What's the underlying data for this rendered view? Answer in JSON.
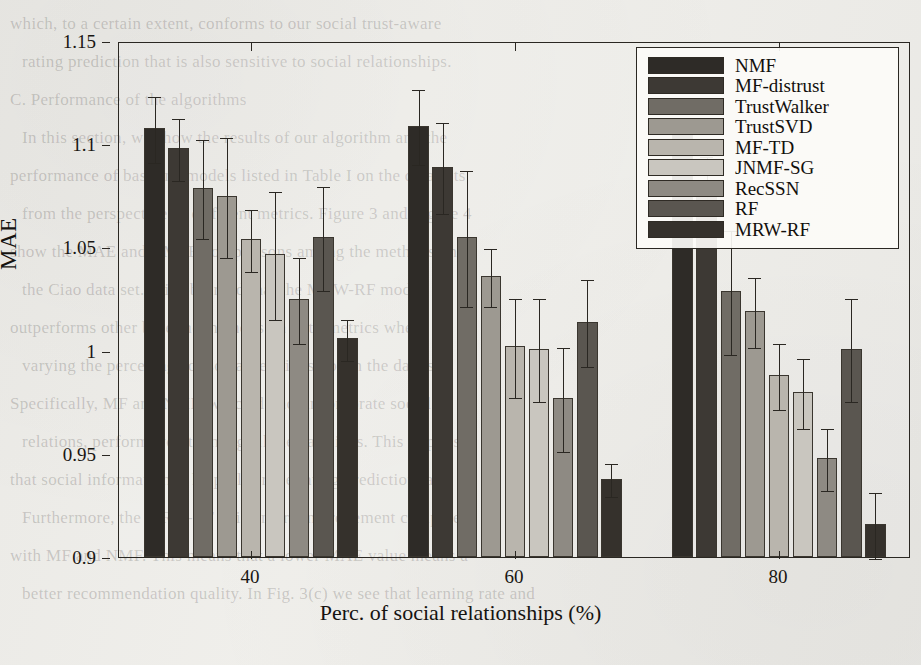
{
  "chart_data": {
    "type": "bar",
    "title": "",
    "xlabel": "Perc. of social relationships (%)",
    "ylabel": "MAE",
    "categories": [
      "40",
      "60",
      "80"
    ],
    "ylim": [
      0.9,
      1.15
    ],
    "ytick_labels": [
      "1.15",
      "1.1",
      "1.05",
      "1",
      "0.95",
      "0.9"
    ],
    "ytick_values": [
      1.15,
      1.1,
      1.05,
      1.0,
      0.95,
      0.9
    ],
    "grid": false,
    "legend_position": "top-right",
    "error_bars": "upper-and-lower whiskers",
    "series": [
      {
        "name": "NMF",
        "color": "#2e2b27",
        "values": [
          1.108,
          1.109,
          1.11
        ],
        "errors": [
          0.016,
          0.018,
          0.0
        ]
      },
      {
        "name": "MF-distrust",
        "color": "#3d3934",
        "values": [
          1.098,
          1.089,
          1.081
        ],
        "errors": [
          0.015,
          0.022,
          0.014
        ]
      },
      {
        "name": "TrustWalker",
        "color": "#706c65",
        "values": [
          1.079,
          1.055,
          1.029
        ],
        "errors": [
          0.024,
          0.033,
          0.03
        ]
      },
      {
        "name": "TrustSVD",
        "color": "#9d9991",
        "values": [
          1.075,
          1.036,
          1.019
        ],
        "errors": [
          0.029,
          0.014,
          0.017
        ]
      },
      {
        "name": "MF-TD",
        "color": "#b9b5ad",
        "values": [
          1.054,
          1.002,
          0.988
        ],
        "errors": [
          0.015,
          0.024,
          0.016
        ]
      },
      {
        "name": "JNMF-SG",
        "color": "#c9c6bf",
        "values": [
          1.047,
          1.001,
          0.98
        ],
        "errors": [
          0.031,
          0.025,
          0.017
        ]
      },
      {
        "name": "RecSSN",
        "color": "#8e8a83",
        "values": [
          1.025,
          0.977,
          0.948
        ],
        "errors": [
          0.021,
          0.025,
          0.015
        ]
      },
      {
        "name": "RF",
        "color": "#5a5650",
        "values": [
          1.055,
          1.014,
          1.001
        ],
        "errors": [
          0.025,
          0.021,
          0.025
        ]
      },
      {
        "name": "MRW-RF",
        "color": "#35312c",
        "values": [
          1.006,
          0.938,
          0.916
        ],
        "errors": [
          0.01,
          0.008,
          0.016
        ]
      }
    ]
  },
  "background_text": {
    "lines": [
      "which, to a certain extent, conforms to our social trust-aware",
      "rating prediction that is also sensitive to social relationships.",
      "C. Performance of the algorithms",
      "In this section, we show the results of our algorithm and the",
      "performance of baseline models listed in Table I on the data sets",
      "from the perspective of different metrics. Figure 3 and Figure 4",
      "show the MAE and RMSE comparisons among the methods on",
      "the Ciao data set. It is observed that the MRW-RF model",
      "outperforms other baseline methods on both metrics when",
      "varying the percentage of social relationships in the data set.",
      "Specifically, MF and NMF, which do not incorporate social",
      "relations, perform worst among all the baselines. This implies",
      "that social information is helpful for the rating prediction task.",
      "Furthermore, the MRW-RF gains more improvement compared",
      "with MF and NMF. This means that a lower MAE value means a",
      "better recommendation quality. In Fig. 3(c) we see that learning rate and"
    ]
  }
}
